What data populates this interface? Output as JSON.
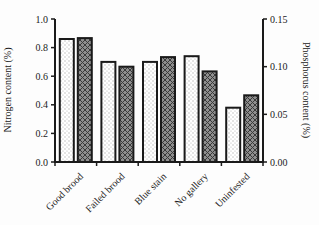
{
  "chart_data": {
    "type": "bar",
    "title": "",
    "categories": [
      "Good brood",
      "Failed brood",
      "Blue stain",
      "No gallery",
      "Uninfested"
    ],
    "series": [
      {
        "name": "Nitrogen content",
        "axis": "left",
        "pattern": "light-dotted",
        "fill": "#ffffff",
        "dot_color": "#b3b3b3",
        "values": [
          0.86,
          0.7,
          0.7,
          0.74,
          0.38
        ]
      },
      {
        "name": "Phosphorus content",
        "axis": "right",
        "pattern": "gray-crosshatch",
        "fill": "#8e8e8e",
        "hatch_color": "#3a3a3a",
        "values": [
          0.13,
          0.1,
          0.11,
          0.095,
          0.07
        ]
      }
    ],
    "left_axis": {
      "label": "Nitrogen content (%)",
      "ticks": [
        "0.0",
        "0.2",
        "0.4",
        "0.6",
        "0.8",
        "1.0"
      ],
      "min": 0,
      "max": 1.0
    },
    "right_axis": {
      "label": "Phosphorus content (%)",
      "ticks": [
        "0.00",
        "0.05",
        "0.10",
        "0.15"
      ],
      "min": 0,
      "max": 0.15
    },
    "colors": {
      "axis": "#1a1a1a",
      "text": "#1a1a1a",
      "background": "#ffffff"
    },
    "legend": "none",
    "grid": false
  }
}
